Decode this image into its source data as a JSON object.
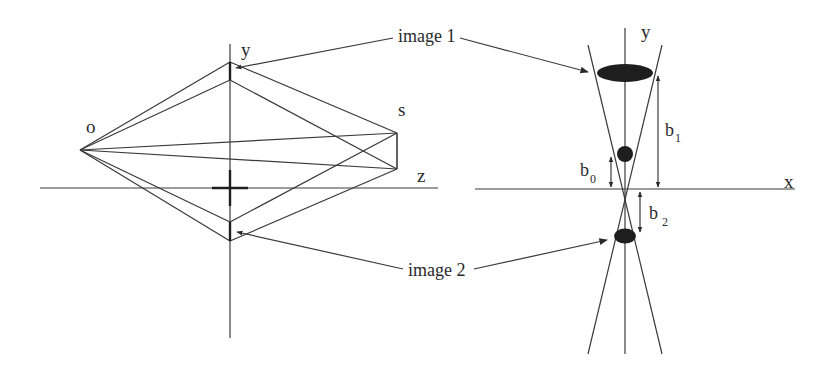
{
  "figure": {
    "left_diagram": {
      "labels": {
        "origin": "o",
        "y_axis": "y",
        "s_point": "s",
        "z_point": "z"
      }
    },
    "right_diagram": {
      "labels": {
        "y_axis": "y",
        "x_axis": "x",
        "b0": "b",
        "b0_sub": "0",
        "b1": "b",
        "b1_sub": "1",
        "b2": "b",
        "b2_sub": "2"
      }
    },
    "callouts": {
      "image1": "image 1",
      "image2": "image 2"
    },
    "colors": {
      "line": "#3a3a3a",
      "fill": "#1e1e1e",
      "background": "#ffffff"
    }
  }
}
